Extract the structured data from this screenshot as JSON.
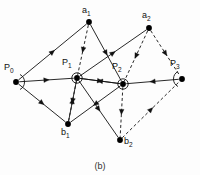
{
  "figure": {
    "caption": "(b)",
    "stroke_color": "#111111",
    "node_color": "#000000",
    "background": "#fdfdfd"
  },
  "nodes": [
    {
      "id": "P0",
      "label": "P",
      "sub": "0",
      "x": 16,
      "y": 82,
      "lx": 4,
      "ly": 63,
      "marker": "angle-arc"
    },
    {
      "id": "P1",
      "label": "P",
      "sub": "1",
      "x": 77,
      "y": 78,
      "lx": 62,
      "ly": 58,
      "marker": "circle"
    },
    {
      "id": "P2",
      "label": "P",
      "sub": "2",
      "x": 123,
      "y": 84,
      "lx": 112,
      "ly": 62,
      "marker": "circle"
    },
    {
      "id": "P3",
      "label": "P",
      "sub": "3",
      "x": 182,
      "y": 79,
      "lx": 170,
      "ly": 59,
      "marker": "angle-arc"
    },
    {
      "id": "a1",
      "label": "a",
      "sub": "1",
      "x": 89,
      "y": 22,
      "lx": 82,
      "ly": 6,
      "marker": "none"
    },
    {
      "id": "a2",
      "label": "a",
      "sub": "2",
      "x": 149,
      "y": 28,
      "lx": 142,
      "ly": 11,
      "marker": "none"
    },
    {
      "id": "b1",
      "label": "b",
      "sub": "1",
      "x": 68,
      "y": 124,
      "lx": 61,
      "ly": 128,
      "marker": "none"
    },
    {
      "id": "b2",
      "label": "b",
      "sub": "2",
      "x": 120,
      "y": 140,
      "lx": 124,
      "ly": 137,
      "marker": "none"
    }
  ],
  "edges": [
    {
      "from": "P0",
      "to": "a1",
      "style": "solid",
      "arrow": "mid"
    },
    {
      "from": "P0",
      "to": "P1",
      "style": "solid",
      "arrow": "mid"
    },
    {
      "from": "P0",
      "to": "b1",
      "style": "solid",
      "arrow": "mid"
    },
    {
      "from": "b1",
      "to": "P1",
      "style": "dashed",
      "arrow": "mid"
    },
    {
      "from": "a1",
      "to": "P1",
      "style": "dashed",
      "arrow": "mid"
    },
    {
      "from": "a1",
      "to": "P2",
      "style": "solid",
      "arrow": "mid"
    },
    {
      "from": "P1",
      "to": "a2",
      "style": "solid",
      "arrow": "mid"
    },
    {
      "from": "P1",
      "to": "P2",
      "style": "solid",
      "arrow": "mid"
    },
    {
      "from": "P2",
      "to": "P1",
      "style": "solid",
      "arrow": "mid"
    },
    {
      "from": "P1",
      "to": "b1",
      "style": "solid",
      "arrow": "mid"
    },
    {
      "from": "P1",
      "to": "b2",
      "style": "solid",
      "arrow": "mid"
    },
    {
      "from": "P2",
      "to": "b1",
      "style": "solid",
      "arrow": "mid"
    },
    {
      "from": "P2",
      "to": "b2",
      "style": "dashed",
      "arrow": "mid"
    },
    {
      "from": "a2",
      "to": "P2",
      "style": "dashed",
      "arrow": "mid"
    },
    {
      "from": "a2",
      "to": "P3",
      "style": "dashed",
      "arrow": "mid"
    },
    {
      "from": "P3",
      "to": "P2",
      "style": "solid",
      "arrow": "mid"
    },
    {
      "from": "b2",
      "to": "P3",
      "style": "dashed",
      "arrow": "mid"
    }
  ],
  "chart_data": {
    "type": "diagram",
    "title": "(b)"
  }
}
